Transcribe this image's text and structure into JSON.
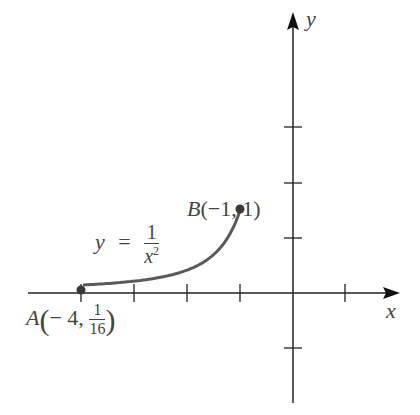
{
  "diagram": {
    "axes": {
      "x_label": "x",
      "y_label": "y",
      "origin_px": [
        293,
        293
      ],
      "unit_px": 52.5,
      "x_ticks": [
        -4,
        -3,
        -2,
        -1,
        1
      ],
      "y_ticks": [
        -1,
        1,
        2,
        3
      ]
    },
    "curve": {
      "equation_lhs": "y",
      "equation_eq": "=",
      "equation_num": "1",
      "equation_den_base": "x",
      "equation_den_exp": "2",
      "domain": [
        -4,
        -1
      ],
      "color": "#5a5a5a"
    },
    "points": {
      "A": {
        "name": "A",
        "x_text": "− 4,",
        "y_num": "1",
        "y_den": "16",
        "x": -4,
        "y": 0.0625
      },
      "B": {
        "name": "B",
        "coords_text": "(−1, 1)",
        "x": -1,
        "y": 1
      }
    },
    "colors": {
      "axis": "#222222",
      "text": "#444444",
      "curve": "#5a5a5a",
      "point": "#3a3a3a"
    }
  }
}
